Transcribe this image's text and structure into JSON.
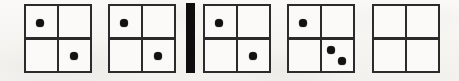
{
  "figure": {
    "kind": "dot-grid-sequence",
    "width": 459,
    "height": 81,
    "background_color": "#f7f6f4",
    "stroke_color": "#2b2b2b",
    "dot_color": "#121212",
    "separator_color": "#0d0d0d",
    "panel_count": 5,
    "separator_count": 1
  },
  "panels": [
    {
      "index": 1,
      "name": "panel-1",
      "label": "Grid 1",
      "x": 24,
      "y": 4,
      "width": 68,
      "height": 69,
      "dot_count": 2,
      "dots": [
        {
          "name": "dot-top-left",
          "quadrant": "top-left",
          "cx": 16,
          "cy": 19,
          "r": 3.6
        },
        {
          "name": "dot-bottom-right",
          "quadrant": "bottom-right",
          "cx": 50,
          "cy": 52,
          "r": 3.6
        }
      ]
    },
    {
      "index": 2,
      "name": "panel-2",
      "label": "Grid 2",
      "x": 108,
      "y": 4,
      "width": 68,
      "height": 69,
      "dot_count": 2,
      "dots": [
        {
          "name": "dot-top-left",
          "quadrant": "top-left",
          "cx": 16,
          "cy": 19,
          "r": 3.6
        },
        {
          "name": "dot-bottom-right",
          "quadrant": "bottom-right",
          "cx": 50,
          "cy": 52,
          "r": 3.6
        }
      ]
    },
    {
      "index": 3,
      "name": "panel-3",
      "label": "Grid 3",
      "x": 203,
      "y": 4,
      "width": 68,
      "height": 69,
      "dot_count": 2,
      "dots": [
        {
          "name": "dot-top-left",
          "quadrant": "top-left",
          "cx": 16,
          "cy": 19,
          "r": 3.6
        },
        {
          "name": "dot-bottom-right",
          "quadrant": "bottom-right",
          "cx": 50,
          "cy": 52,
          "r": 3.6
        }
      ]
    },
    {
      "index": 4,
      "name": "panel-4",
      "label": "Grid 4",
      "x": 287,
      "y": 4,
      "width": 68,
      "height": 69,
      "dot_count": 3,
      "dots": [
        {
          "name": "dot-top-left",
          "quadrant": "top-left",
          "cx": 16,
          "cy": 19,
          "r": 3.6
        },
        {
          "name": "dot-bottom-right-upper",
          "quadrant": "bottom-right",
          "cx": 44,
          "cy": 46,
          "r": 3.6
        },
        {
          "name": "dot-bottom-right-lower",
          "quadrant": "bottom-right",
          "cx": 55,
          "cy": 57,
          "r": 3.6
        }
      ]
    },
    {
      "index": 5,
      "name": "panel-5",
      "label": "Grid 5",
      "x": 372,
      "y": 4,
      "width": 68,
      "height": 69,
      "dot_count": 0,
      "dots": []
    }
  ],
  "separators": [
    {
      "index": 1,
      "name": "separator-bar",
      "label": "Vertical separator bar",
      "x": 186,
      "y": 3,
      "width": 9,
      "height": 70,
      "after_panel": 2
    }
  ]
}
